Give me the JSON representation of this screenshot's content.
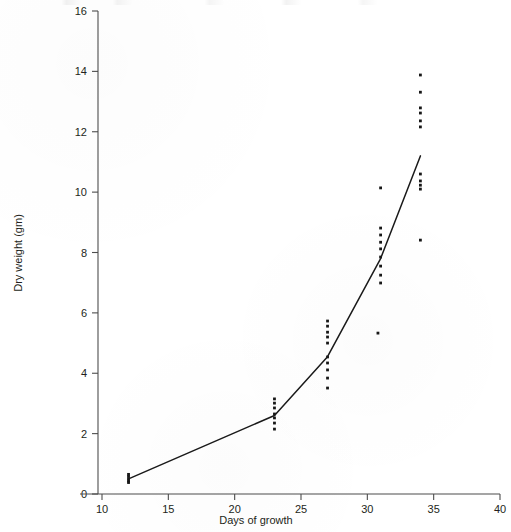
{
  "chart_data": {
    "type": "scatter",
    "title": "",
    "xlabel": "Days of growth",
    "ylabel": "Dry weight (gm)",
    "xlim": [
      10,
      40
    ],
    "ylim": [
      0,
      16
    ],
    "xticks": [
      10,
      15,
      20,
      25,
      30,
      35,
      40
    ],
    "xtick_labels": [
      "10",
      "15",
      "20",
      "25",
      "30",
      "35",
      "40"
    ],
    "yticks": [
      0,
      2,
      4,
      6,
      8,
      10,
      12,
      14,
      16
    ],
    "ytick_labels": [
      "0",
      "2",
      "4",
      "6",
      "8",
      "10",
      "12",
      "14",
      "16"
    ],
    "grid": false,
    "legend": null,
    "series": [
      {
        "name": "Dry weight observations",
        "marker": "dot",
        "color": "#171717",
        "points": [
          {
            "x": 12,
            "y": 0.65
          },
          {
            "x": 12,
            "y": 0.58
          },
          {
            "x": 12,
            "y": 0.5
          },
          {
            "x": 12,
            "y": 0.43
          },
          {
            "x": 12,
            "y": 0.38
          },
          {
            "x": 23,
            "y": 3.15
          },
          {
            "x": 23,
            "y": 3.01
          },
          {
            "x": 23,
            "y": 2.85
          },
          {
            "x": 23,
            "y": 2.65
          },
          {
            "x": 23,
            "y": 2.52
          },
          {
            "x": 23,
            "y": 2.35
          },
          {
            "x": 23,
            "y": 2.15
          },
          {
            "x": 27,
            "y": 5.73
          },
          {
            "x": 27,
            "y": 5.56
          },
          {
            "x": 27,
            "y": 5.36
          },
          {
            "x": 27,
            "y": 5.2
          },
          {
            "x": 27,
            "y": 5.0
          },
          {
            "x": 27,
            "y": 4.54
          },
          {
            "x": 27,
            "y": 4.34
          },
          {
            "x": 27,
            "y": 4.11
          },
          {
            "x": 27,
            "y": 3.84
          },
          {
            "x": 27,
            "y": 3.51
          },
          {
            "x": 31,
            "y": 10.14
          },
          {
            "x": 31,
            "y": 8.81
          },
          {
            "x": 31,
            "y": 8.58
          },
          {
            "x": 31,
            "y": 8.34
          },
          {
            "x": 31,
            "y": 8.12
          },
          {
            "x": 31,
            "y": 7.85
          },
          {
            "x": 31,
            "y": 7.55
          },
          {
            "x": 31,
            "y": 7.25
          },
          {
            "x": 31,
            "y": 6.99
          },
          {
            "x": 30.8,
            "y": 5.33
          },
          {
            "x": 34,
            "y": 13.88
          },
          {
            "x": 34,
            "y": 13.31
          },
          {
            "x": 34,
            "y": 12.79
          },
          {
            "x": 34,
            "y": 12.62
          },
          {
            "x": 34,
            "y": 12.36
          },
          {
            "x": 34,
            "y": 12.16
          },
          {
            "x": 34,
            "y": 10.6
          },
          {
            "x": 34,
            "y": 10.37
          },
          {
            "x": 34,
            "y": 10.23
          },
          {
            "x": 34,
            "y": 10.1
          },
          {
            "x": 34,
            "y": 8.41
          }
        ]
      }
    ],
    "fit_line": {
      "name": "Fitted growth curve",
      "color": "#1a1a1a",
      "vertices": [
        {
          "x": 12,
          "y": 0.5
        },
        {
          "x": 23,
          "y": 2.6
        },
        {
          "x": 27,
          "y": 4.55
        },
        {
          "x": 31,
          "y": 7.8
        },
        {
          "x": 34,
          "y": 11.2
        }
      ]
    }
  },
  "axes": {
    "x_axis_name": "x-axis",
    "y_axis_name": "y-axis"
  }
}
